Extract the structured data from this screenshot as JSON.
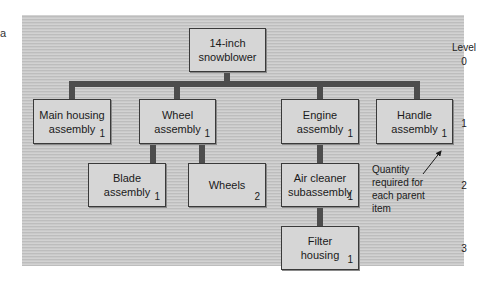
{
  "edge_fragment": "a",
  "diagram": {
    "title_node": {
      "label": "14-inch\nsnowblower",
      "quantity": ""
    },
    "level_header": "Level",
    "levels": [
      "0",
      "1",
      "2",
      "3"
    ],
    "nodes": [
      {
        "id": "snowblower",
        "label": "14-inch\nsnowblower",
        "quantity": "",
        "level": 0,
        "parent": null
      },
      {
        "id": "main-housing",
        "label": "Main housing\nassembly",
        "quantity": "1",
        "level": 1,
        "parent": "snowblower"
      },
      {
        "id": "wheel-assembly",
        "label": "Wheel\nassembly",
        "quantity": "1",
        "level": 1,
        "parent": "snowblower"
      },
      {
        "id": "engine-assembly",
        "label": "Engine\nassembly",
        "quantity": "1",
        "level": 1,
        "parent": "snowblower"
      },
      {
        "id": "handle-assembly",
        "label": "Handle\nassembly",
        "quantity": "1",
        "level": 1,
        "parent": "snowblower"
      },
      {
        "id": "blade-assembly",
        "label": "Blade\nassembly",
        "quantity": "1",
        "level": 2,
        "parent": "wheel-assembly"
      },
      {
        "id": "wheels",
        "label": "Wheels",
        "quantity": "2",
        "level": 2,
        "parent": "wheel-assembly"
      },
      {
        "id": "air-cleaner",
        "label": "Air cleaner\nsubassembly",
        "quantity": "1",
        "level": 2,
        "parent": "engine-assembly"
      },
      {
        "id": "filter-housing",
        "label": "Filter\nhousing",
        "quantity": "1",
        "level": 3,
        "parent": "air-cleaner"
      }
    ],
    "annotation": "Quantity\nrequired for\neach parent\nitem",
    "colors": {
      "panel": "#c8c8c8",
      "node_fill": "#d6d6d6",
      "connector": "#4d4d4d",
      "border": "#3a3a3a"
    }
  }
}
